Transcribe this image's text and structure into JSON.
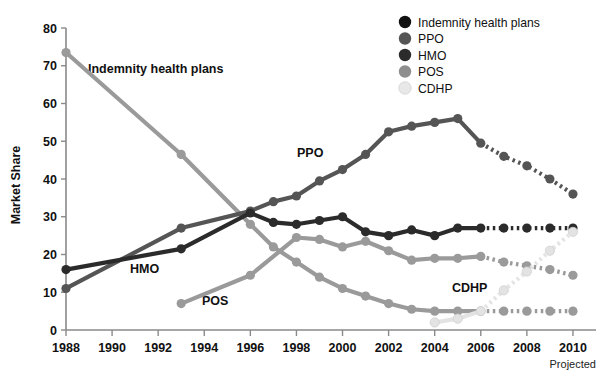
{
  "chart_data": {
    "type": "line",
    "title": "",
    "xlabel": "",
    "ylabel": "Market Share",
    "xlim": [
      1988,
      2011
    ],
    "ylim": [
      0,
      80
    ],
    "grid": false,
    "legend_position": "top-right",
    "x_ticks": [
      1988,
      1990,
      1992,
      1994,
      1996,
      1998,
      2000,
      2002,
      2004,
      2006,
      2008,
      2010
    ],
    "y_ticks": [
      0,
      10,
      20,
      30,
      40,
      50,
      60,
      70,
      80
    ],
    "projected_note": "Projected",
    "projection_starts_year": 2006,
    "series": [
      {
        "name": "Indemnity health plans",
        "color": "#9a9a9a",
        "legend_marker_color": "#111111",
        "x": [
          1988,
          1993,
          1996,
          1997,
          1998,
          1999,
          2000,
          2001,
          2002,
          2003,
          2004,
          2005,
          2006,
          2007,
          2008,
          2009,
          2010
        ],
        "values": [
          73.5,
          46.5,
          28.0,
          22.0,
          18.0,
          14.0,
          11.0,
          9.0,
          7.0,
          5.5,
          5.0,
          5.0,
          5.0,
          5.0,
          5.0,
          5.0,
          5.0
        ]
      },
      {
        "name": "PPO",
        "color": "#555555",
        "legend_marker_color": "#555555",
        "x": [
          1988,
          1993,
          1996,
          1997,
          1998,
          1999,
          2000,
          2001,
          2002,
          2003,
          2004,
          2005,
          2006,
          2007,
          2008,
          2009,
          2010
        ],
        "values": [
          11.0,
          27.0,
          31.5,
          34.0,
          35.5,
          39.5,
          42.5,
          46.5,
          52.5,
          54.0,
          55.0,
          56.0,
          49.5,
          46.0,
          43.5,
          40.0,
          36.0
        ]
      },
      {
        "name": "HMO",
        "color": "#2b2b2b",
        "legend_marker_color": "#2b2b2b",
        "x": [
          1988,
          1993,
          1996,
          1997,
          1998,
          1999,
          2000,
          2001,
          2002,
          2003,
          2004,
          2005,
          2006,
          2007,
          2008,
          2009,
          2010
        ],
        "values": [
          16.0,
          21.5,
          31.0,
          28.5,
          28.0,
          29.0,
          30.0,
          26.0,
          25.0,
          26.5,
          25.0,
          27.0,
          27.0,
          27.0,
          27.0,
          27.0,
          27.0
        ]
      },
      {
        "name": "POS",
        "color": "#9a9a9a",
        "legend_marker_color": "#8e8e8e",
        "x": [
          1993,
          1996,
          1998,
          1999,
          2000,
          2001,
          2002,
          2003,
          2004,
          2005,
          2006,
          2007,
          2008,
          2009,
          2010
        ],
        "values": [
          7.0,
          14.5,
          24.5,
          24.0,
          22.0,
          23.5,
          21.0,
          18.5,
          19.0,
          19.0,
          19.5,
          18.0,
          17.0,
          16.0,
          14.5
        ]
      },
      {
        "name": "CDHP",
        "color": "#e3e3e3",
        "legend_marker_color": "#e8e8e8",
        "x": [
          2004,
          2005,
          2006,
          2007,
          2008,
          2009,
          2010
        ],
        "values": [
          2.0,
          3.0,
          5.0,
          10.5,
          15.5,
          21.0,
          26.0
        ]
      }
    ]
  },
  "legend": {
    "items": [
      {
        "label": "Indemnity health plans"
      },
      {
        "label": "PPO"
      },
      {
        "label": "HMO"
      },
      {
        "label": "POS"
      },
      {
        "label": "CDHP"
      }
    ]
  },
  "inline_labels": [
    {
      "text": "Indemnity health plans",
      "x": 88,
      "y": 73
    },
    {
      "text": "PPO",
      "x": 297,
      "y": 157
    },
    {
      "text": "HMO",
      "x": 130,
      "y": 273
    },
    {
      "text": "POS",
      "x": 202,
      "y": 305
    },
    {
      "text": "CDHP",
      "x": 452,
      "y": 292
    }
  ]
}
